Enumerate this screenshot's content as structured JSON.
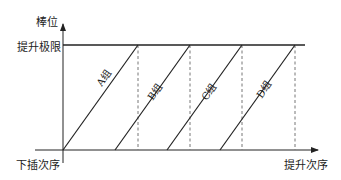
{
  "diagram": {
    "y_axis_label": "棒位",
    "x_axis_label": "提升次序",
    "origin_label": "下插次序",
    "limit_label": "提升极限",
    "groups": [
      {
        "label": "A组"
      },
      {
        "label": "B组"
      },
      {
        "label": "C组"
      },
      {
        "label": "D组"
      }
    ],
    "colors": {
      "line": "#222222",
      "dashed": "#666666",
      "background": "#ffffff"
    }
  }
}
